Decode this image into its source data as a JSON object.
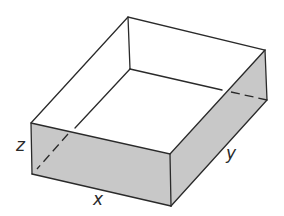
{
  "figure": {
    "type": "open-top rectangular box, oblique projection",
    "labels": {
      "x": "x",
      "y": "y",
      "z": "z"
    },
    "colors": {
      "edge": "#2a2a2a",
      "shaded_face": "#c8c8c8",
      "background": "#ffffff"
    }
  }
}
